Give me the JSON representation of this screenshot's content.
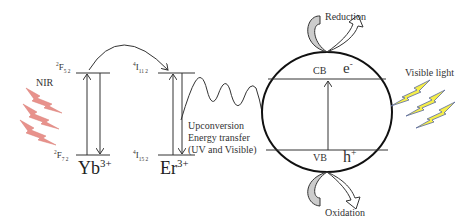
{
  "diagram": {
    "left_light": {
      "label": "NIR",
      "color": "#e8928c"
    },
    "right_light": {
      "label": "Visible light",
      "color": "#f5ee4a",
      "outline": "#5a6aa0"
    },
    "yb": {
      "ion": "Yb",
      "charge": "3+",
      "upper_level": {
        "sup": "2",
        "term": "F",
        "sub": "5 2"
      },
      "lower_level": {
        "sup": "2",
        "term": "F",
        "sub": "7 2"
      }
    },
    "er": {
      "ion": "Er",
      "charge": "3+",
      "upper_level": {
        "sup": "4",
        "term": "I",
        "sub": "11 2"
      },
      "lower_level": {
        "sup": "4",
        "term": "I",
        "sub": "15 2"
      }
    },
    "transfer_text": [
      "Upconversion",
      "Energy transfer",
      "(UV and Visible)"
    ],
    "semiconductor": {
      "cb_label": "CB",
      "vb_label": "VB",
      "electron": "e",
      "electron_sup": "-",
      "hole": "h",
      "hole_sup": "+"
    },
    "reduction_label": "Reduction",
    "oxidation_label": "Oxidation",
    "colors": {
      "line": "#333333",
      "arrow_fill": "#cccccc"
    }
  }
}
